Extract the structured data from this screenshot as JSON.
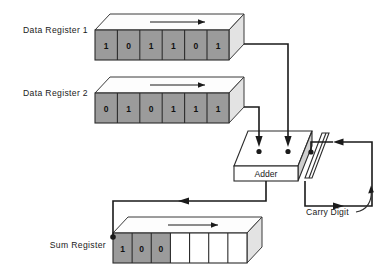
{
  "diagram": {
    "title_visible": false,
    "registers": [
      {
        "id": "data-register-1",
        "label": "Data Register 1",
        "bits": [
          "1",
          "0",
          "1",
          "1",
          "0",
          "1"
        ],
        "filled": [
          true,
          true,
          true,
          true,
          true,
          true
        ]
      },
      {
        "id": "data-register-2",
        "label": "Data Register 2",
        "bits": [
          "0",
          "1",
          "0",
          "1",
          "1",
          "1"
        ],
        "filled": [
          true,
          true,
          true,
          true,
          true,
          true
        ]
      },
      {
        "id": "sum-register",
        "label": "Sum  Register",
        "bits": [
          "1",
          "0",
          "0",
          "",
          "",
          "",
          ""
        ],
        "filled": [
          true,
          true,
          true,
          false,
          false,
          false,
          false
        ]
      }
    ],
    "adder": {
      "label": "Adder"
    },
    "carry": {
      "label": "Carry Digit"
    },
    "colors": {
      "cell_fill": "#9b9b9b",
      "cell_empty": "#ffffff",
      "top_face": "#fdfdfd",
      "side_face": "#e3e3e3",
      "line": "#1a1a1a",
      "text": "#1a1a1a",
      "background": "#ffffff"
    }
  }
}
